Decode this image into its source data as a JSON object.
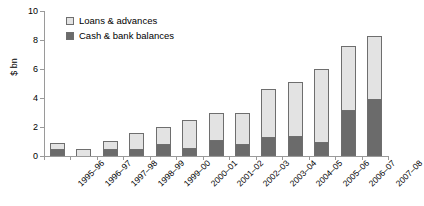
{
  "chart_data": {
    "type": "bar",
    "title": "",
    "subtitle": "",
    "xlabel": "",
    "ylabel": "$ bn",
    "ylim": [
      0,
      10
    ],
    "yticks": [
      0,
      2,
      4,
      6,
      8,
      10
    ],
    "grid": false,
    "stacked": true,
    "legend_position": "top-left",
    "categories": [
      "1995–96",
      "1996–97",
      "1997–98",
      "1998–99",
      "1999–00",
      "2000–01",
      "2001–02",
      "2002–03",
      "2003–04",
      "2004–05",
      "2005–06",
      "2006–07",
      "2007–08"
    ],
    "series": [
      {
        "name": "Cash & bank balances",
        "color": "#6b6b6b",
        "values": [
          0.5,
          0.0,
          0.5,
          0.5,
          0.85,
          0.55,
          1.1,
          0.8,
          1.3,
          1.4,
          1.0,
          3.2,
          3.9
        ]
      },
      {
        "name": "Loans & advances",
        "color": "#e3e3e3",
        "values": [
          0.4,
          0.5,
          0.55,
          1.1,
          1.15,
          1.95,
          1.9,
          2.2,
          3.3,
          3.7,
          5.0,
          4.4,
          4.4
        ]
      }
    ],
    "totals": [
      0.9,
      0.5,
      1.05,
      1.6,
      2.0,
      2.5,
      3.0,
      3.0,
      4.6,
      5.1,
      6.0,
      7.6,
      8.3
    ]
  },
  "legend": {
    "entries": [
      {
        "label": "Loans & advances",
        "swatch": "light"
      },
      {
        "label": "Cash & bank balances",
        "swatch": "dark"
      }
    ]
  },
  "axis": {
    "y_title": "$ bn",
    "y_tick_labels": [
      "0",
      "2",
      "4",
      "6",
      "8",
      "10"
    ]
  }
}
